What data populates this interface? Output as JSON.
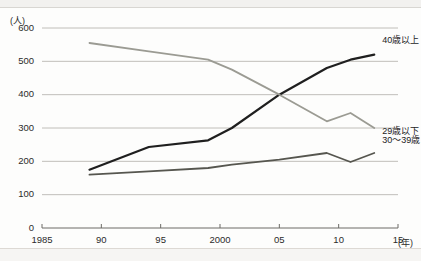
{
  "chart_data": {
    "type": "line",
    "title": "",
    "xlabel": "(年)",
    "ylabel": "(人)",
    "xlim": [
      1985,
      2015
    ],
    "ylim": [
      0,
      600
    ],
    "grid": true,
    "legend_position": "right-inline",
    "x_ticks": [
      "1985",
      "90",
      "95",
      "2000",
      "05",
      "10",
      "15"
    ],
    "x_tick_values": [
      1985,
      1990,
      1995,
      2000,
      2005,
      2010,
      2015
    ],
    "y_ticks": [
      "0",
      "100",
      "200",
      "300",
      "400",
      "500",
      "600"
    ],
    "y_tick_values": [
      0,
      100,
      200,
      300,
      400,
      500,
      600
    ],
    "x": [
      1989,
      1994,
      1999,
      2001,
      2005,
      2009,
      2011,
      2013
    ],
    "series": [
      {
        "name": "40歳以上",
        "label": "40歳以上",
        "color": "#1f1f1f",
        "values": [
          175,
          243,
          263,
          300,
          400,
          480,
          505,
          520
        ]
      },
      {
        "name": "29歳以下",
        "label": "29歳以下",
        "color": "#9b9b93",
        "values": [
          555,
          530,
          505,
          475,
          400,
          320,
          345,
          300
        ]
      },
      {
        "name": "30〜39歳",
        "label": "30〜39歳",
        "color": "#56564f",
        "values": [
          160,
          170,
          180,
          190,
          205,
          225,
          198,
          225
        ]
      }
    ]
  },
  "axis": {
    "y_unit": "(人)",
    "x_unit": "(年)"
  }
}
